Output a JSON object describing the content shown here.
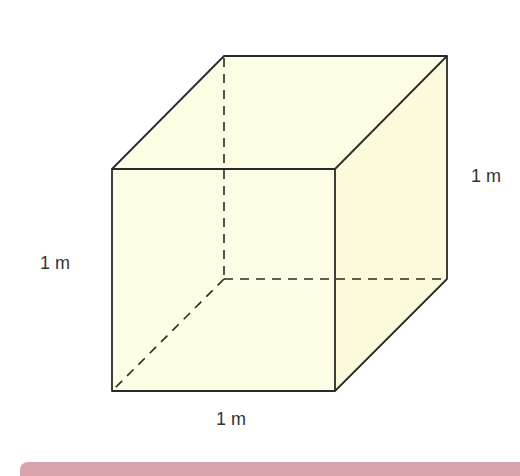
{
  "diagram": {
    "type": "cube",
    "fill_color": "#fdfde3",
    "stroke_color": "#2a2a2a",
    "labels": {
      "height": "1 m",
      "depth": "1 m",
      "width": "1 m"
    }
  },
  "footer_bar": {
    "color": "#d9a3ab"
  }
}
